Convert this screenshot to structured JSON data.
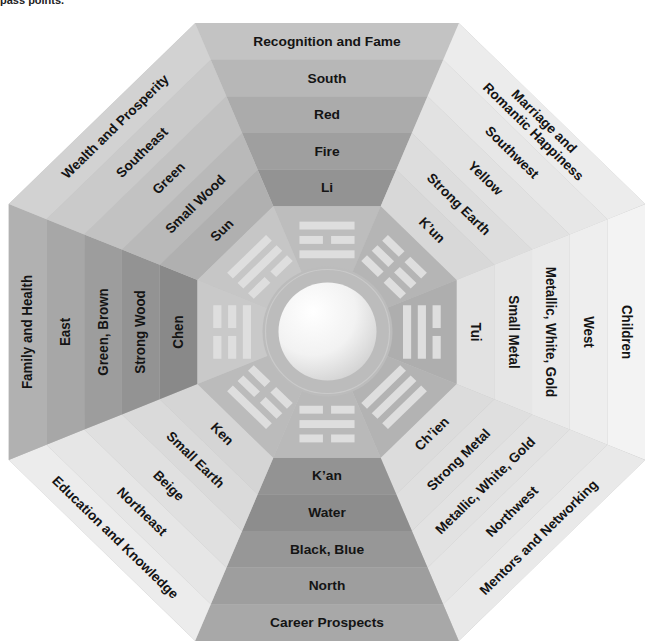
{
  "caption": {
    "fragment": "pass points."
  },
  "trigram_bar_color": "#dedede",
  "center": {
    "ring_color": "#bcbcbc",
    "ring_highlight": "#cacaca"
  },
  "octagon_base_color": "#c4c4c4",
  "sectors": [
    {
      "position": "top",
      "area": [
        "Recognition and Fame"
      ],
      "direction": "South",
      "color": "Red",
      "element": "Fire",
      "trigram": "Li",
      "trigram_lines": [
        "solid",
        "broken",
        "solid"
      ],
      "band_colors": [
        "#c3c3c3",
        "#b7b7b7",
        "#ababab",
        "#9f9f9f",
        "#939393"
      ],
      "trigram_bg": "#bdbdbd"
    },
    {
      "position": "top-right",
      "area": [
        "Marriage and",
        "Romantic Happiness"
      ],
      "direction": "Southwest",
      "color": "Yellow",
      "element": "Strong Earth",
      "trigram": "K’un",
      "trigram_lines": [
        "broken",
        "broken",
        "broken"
      ],
      "band_colors": [
        "#ececec",
        "#e7e7e7",
        "#e2e2e2",
        "#dddddd",
        "#d8d8d8"
      ],
      "trigram_bg": "#b5b5b5"
    },
    {
      "position": "right",
      "area": [
        "Children"
      ],
      "direction": "West",
      "color": "Metallic, White, Gold",
      "element": "Small Metal",
      "trigram": "Tui",
      "trigram_lines": [
        "broken",
        "solid",
        "solid"
      ],
      "band_colors": [
        "#f3f3f3",
        "#eeeeee",
        "#eaeaea",
        "#e6e6e6",
        "#e2e2e2"
      ],
      "trigram_bg": "#aeaeae"
    },
    {
      "position": "bottom-right",
      "area": [
        "Mentors and Networking"
      ],
      "direction": "Northwest",
      "color": "Metallic, White, Gold",
      "element": "Strong Metal",
      "trigram": "Ch’ien",
      "trigram_lines": [
        "solid",
        "solid",
        "solid"
      ],
      "band_colors": [
        "#e9e9e9",
        "#e5e5e5",
        "#e2e2e2",
        "#dfdfdf",
        "#dcdcdc"
      ],
      "trigram_bg": "#b3b3b3"
    },
    {
      "position": "bottom",
      "area": [
        "Career Prospects"
      ],
      "direction": "North",
      "color": "Black, Blue",
      "element": "Water",
      "trigram": "K’an",
      "trigram_lines": [
        "broken",
        "solid",
        "broken"
      ],
      "band_colors": [
        "#a8a8a8",
        "#9e9e9e",
        "#979797",
        "#8d8d8d",
        "#939393"
      ],
      "trigram_bg": "#b9b9b9"
    },
    {
      "position": "bottom-left",
      "area": [
        "Education and Knowledge"
      ],
      "direction": "Northeast",
      "color": "Beige",
      "element": "Small Earth",
      "trigram": "Ken",
      "trigram_lines": [
        "solid",
        "broken",
        "broken"
      ],
      "band_colors": [
        "#ececec",
        "#e6e6e6",
        "#e0e0e0",
        "#dadada",
        "#d5d5d5"
      ],
      "trigram_bg": "#bbbbbb"
    },
    {
      "position": "left",
      "area": [
        "Family and Health"
      ],
      "direction": "East",
      "color": "Green, Brown",
      "element": "Strong Wood",
      "trigram": "Chen",
      "trigram_lines": [
        "broken",
        "broken",
        "solid"
      ],
      "band_colors": [
        "#b1b1b1",
        "#a7a7a7",
        "#9d9d9d",
        "#939393",
        "#898989"
      ],
      "trigram_bg": "#c9c9c9"
    },
    {
      "position": "top-left",
      "area": [
        "Wealth and Prosperity"
      ],
      "direction": "Southeast",
      "color": "Green",
      "element": "Small Wood",
      "trigram": "Sun",
      "trigram_lines": [
        "solid",
        "solid",
        "broken"
      ],
      "band_colors": [
        "#d2d2d2",
        "#cacaca",
        "#c2c2c2",
        "#b9b9b9",
        "#b0b0b0"
      ],
      "trigram_bg": "#c6c6c6"
    }
  ]
}
